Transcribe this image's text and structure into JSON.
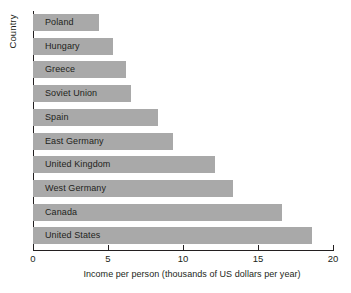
{
  "chart_data": {
    "type": "bar",
    "orientation": "horizontal",
    "title": "",
    "xlabel": "Income per person (thousands of US dollars per year)",
    "ylabel": "Country",
    "categories": [
      "Poland",
      "Hungary",
      "Greece",
      "Soviet Union",
      "Spain",
      "East Germany",
      "United Kingdom",
      "West Germany",
      "Canada",
      "United States"
    ],
    "values": [
      4.4,
      5.3,
      6.2,
      6.5,
      8.3,
      9.3,
      12.1,
      13.3,
      16.6,
      18.6
    ],
    "xlim": [
      0,
      20
    ],
    "xticks": [
      0,
      5,
      10,
      15,
      20
    ],
    "xtick_labels": [
      "0",
      "5",
      "10",
      "15",
      "20"
    ],
    "grid": false,
    "legend": false,
    "bar_color": "#a9a9a9",
    "axis_color": "#231f20",
    "background": "#ffffff"
  }
}
